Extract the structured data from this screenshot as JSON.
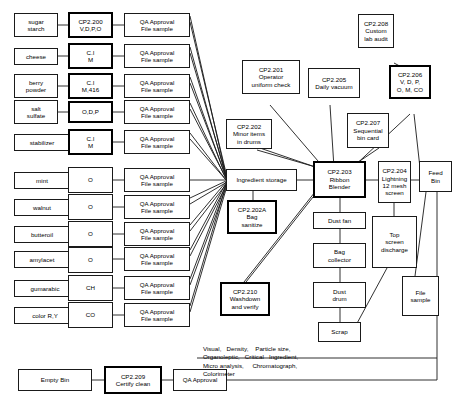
{
  "diagram": {
    "line_color": "#1a1a1a",
    "box_border_color": "#1a1a1a",
    "bold_box_border_color": "#000000",
    "background": "#ffffff"
  },
  "ingredients": [
    {
      "id": "sugar-starch",
      "lines": [
        "sugar",
        "starch"
      ]
    },
    {
      "id": "cheese",
      "lines": [
        "cheese"
      ]
    },
    {
      "id": "berry-powder",
      "lines": [
        "berry",
        "powder"
      ]
    },
    {
      "id": "salt-sulfate",
      "lines": [
        "salt",
        "sulfate"
      ]
    },
    {
      "id": "stabilizer",
      "lines": [
        "stabilizer"
      ]
    },
    {
      "id": "mint",
      "lines": [
        "mint"
      ]
    },
    {
      "id": "walnut",
      "lines": [
        "walnut"
      ]
    },
    {
      "id": "butteroil",
      "lines": [
        "butteroil"
      ]
    },
    {
      "id": "amylacet",
      "lines": [
        "amylacet"
      ]
    },
    {
      "id": "gumarabic",
      "lines": [
        "gumarabic"
      ]
    },
    {
      "id": "color-ry",
      "lines": [
        "color R,Y"
      ]
    }
  ],
  "tests": [
    {
      "id": "test-cp2200",
      "lines": [
        "CP2.200",
        "V,D,P,O"
      ],
      "bold": true
    },
    {
      "id": "test-ci-m-1",
      "lines": [
        "C.I",
        "M"
      ],
      "bold": true
    },
    {
      "id": "test-ci-m416",
      "lines": [
        "C.I",
        "M,416"
      ],
      "bold": true
    },
    {
      "id": "test-odp",
      "lines": [
        "O,D,P"
      ],
      "bold": true
    },
    {
      "id": "test-ci-m-2",
      "lines": [
        "C.I",
        "M"
      ],
      "bold": true
    },
    {
      "id": "test-o-mint",
      "lines": [
        "O"
      ],
      "bold": false
    },
    {
      "id": "test-o-walnut",
      "lines": [
        "O"
      ],
      "bold": false
    },
    {
      "id": "test-o-butteroil",
      "lines": [
        "O"
      ],
      "bold": false
    },
    {
      "id": "test-o-amylacet",
      "lines": [
        "O"
      ],
      "bold": false
    },
    {
      "id": "test-ch",
      "lines": [
        "CH"
      ],
      "bold": false
    },
    {
      "id": "test-co",
      "lines": [
        "CO"
      ],
      "bold": false
    }
  ],
  "qa_boxes": {
    "count": 11,
    "lines": [
      "QA Approval",
      "File sample"
    ]
  },
  "process": {
    "ingredient_storage": {
      "lines": [
        "Ingredient storage"
      ],
      "bold": false
    },
    "ribbon_blender": {
      "lines": [
        "CP2.203",
        "Ribbon",
        "Blender"
      ],
      "bold": true
    },
    "screen": {
      "lines": [
        "CP2.204",
        "Lightning",
        "12 mesh",
        "screen"
      ],
      "bold": false
    },
    "feed_bin": {
      "lines": [
        "Feed",
        "Bin"
      ],
      "bold": false
    },
    "dust_fan": {
      "lines": [
        "Dust fan"
      ],
      "bold": false
    },
    "bag_collector": {
      "lines": [
        "Bag",
        "collector"
      ],
      "bold": false
    },
    "dust_drum": {
      "lines": [
        "Dust",
        "drum"
      ],
      "bold": false
    },
    "scrap": {
      "lines": [
        "Scrap"
      ],
      "bold": false
    },
    "top_screen_discharge": {
      "lines": [
        "Top",
        "screen",
        "discharge"
      ],
      "bold": false
    },
    "file_sample": {
      "lines": [
        "File",
        "sample"
      ],
      "bold": false
    },
    "empty_bin": {
      "lines": [
        "Empty Bin"
      ],
      "bold": false
    },
    "certify_clean": {
      "lines": [
        "CP2.209",
        "Certify clean"
      ],
      "bold": true
    },
    "qa_approval_bottom": {
      "lines": [
        "QA Approval"
      ],
      "bold": false
    }
  },
  "control_points": {
    "cp2201": {
      "lines": [
        "CP2.201",
        "Operator",
        "uniform check"
      ],
      "bold": false
    },
    "cp2202": {
      "lines": [
        "CP2.202",
        "Minor items",
        "in drums"
      ],
      "bold": false
    },
    "cp2202a": {
      "lines": [
        "CP2.202A",
        "Bag",
        "sanitize"
      ],
      "bold": true
    },
    "cp2205": {
      "lines": [
        "CP2.205",
        "Daily vacuum"
      ],
      "bold": false
    },
    "cp2207": {
      "lines": [
        "CP2.207",
        "Sequential",
        "bin card"
      ],
      "bold": false
    },
    "cp2208": {
      "lines": [
        "CP2.208",
        "Custom",
        "lab audit"
      ],
      "bold": false
    },
    "cp2206": {
      "lines": [
        "CP2.206",
        "V, D, P,",
        "O, M, CO"
      ],
      "bold": true
    },
    "cp2210": {
      "lines": [
        "CP2.210",
        "Washdown",
        "and verify"
      ],
      "bold": true
    }
  },
  "legend": {
    "lines": [
      "Visual,   Density,    Particle size,",
      "Organoleptic,   Critical   Ingredient,",
      "Micro analysis,     Chromatograph,",
      "Colorimeter"
    ]
  }
}
